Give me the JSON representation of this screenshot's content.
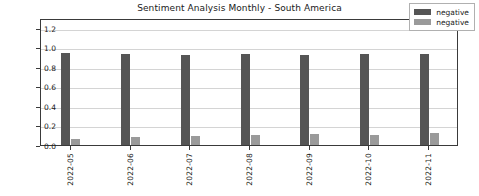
{
  "chart_data": {
    "type": "bar",
    "title": "Sentiment Analysis Monthly - South America",
    "xlabel": "",
    "ylabel": "",
    "categories": [
      "2022-05",
      "2022-06",
      "2022-07",
      "2022-08",
      "2022-09",
      "2022-10",
      "2022-11"
    ],
    "series": [
      {
        "name": "negative",
        "color": "#555555",
        "values": [
          0.94,
          0.93,
          0.92,
          0.93,
          0.92,
          0.93,
          0.93
        ]
      },
      {
        "name": "negative",
        "color": "#9a9a9a",
        "values": [
          0.06,
          0.08,
          0.09,
          0.1,
          0.11,
          0.1,
          0.12
        ]
      }
    ],
    "ylim": [
      0.0,
      1.3
    ],
    "yticks": [
      "0.0",
      "0.2",
      "0.4",
      "0.6",
      "0.8",
      "1.0",
      "1.2"
    ],
    "ytick_values": [
      0.0,
      0.2,
      0.4,
      0.6,
      0.8,
      1.0,
      1.2
    ],
    "grid": true,
    "grid_axis": "y",
    "legend_position": "upper right"
  }
}
